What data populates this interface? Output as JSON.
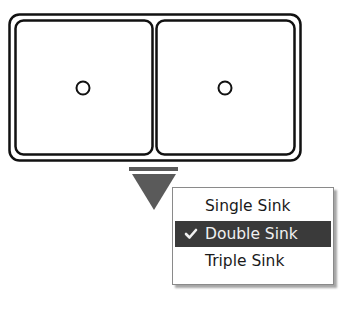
{
  "sink": {
    "layout": "double",
    "basins": [
      {
        "id": "left",
        "drain": true
      },
      {
        "id": "right",
        "drain": true
      }
    ]
  },
  "dropdown_trigger": {
    "icon": "triangle-down-icon",
    "color": "#5a5a5a"
  },
  "menu": {
    "items": [
      {
        "label": "Single Sink",
        "selected": false
      },
      {
        "label": "Double Sink",
        "selected": true
      },
      {
        "label": "Triple Sink",
        "selected": false
      }
    ],
    "selected_bg": "#3a3a3a",
    "check_icon": "checkmark-icon"
  }
}
